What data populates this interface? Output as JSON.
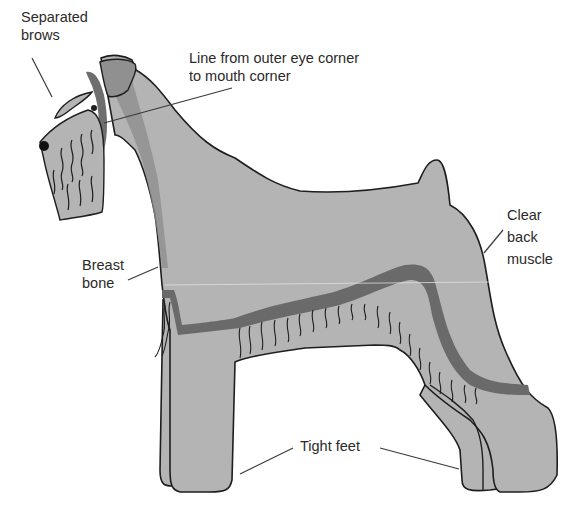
{
  "diagram": {
    "colors": {
      "coat": "#b4b4b4",
      "coat_dark": "#8e8e8e",
      "band": "#6a6a6a",
      "outline": "#1e1e1e",
      "leader": "#3a3a3a",
      "background": "#ffffff"
    },
    "labels": [
      {
        "id": "separated-brows",
        "lines": [
          "Separated",
          "brows"
        ]
      },
      {
        "id": "eye-mouth-line",
        "lines": [
          "Line from outer eye corner",
          "to mouth corner"
        ]
      },
      {
        "id": "breast-bone",
        "lines": [
          "Breast",
          "bone"
        ]
      },
      {
        "id": "clear-back-muscle",
        "lines": [
          "Clear",
          "back",
          "muscle"
        ]
      },
      {
        "id": "tight-feet",
        "lines": [
          "Tight feet"
        ]
      }
    ]
  }
}
